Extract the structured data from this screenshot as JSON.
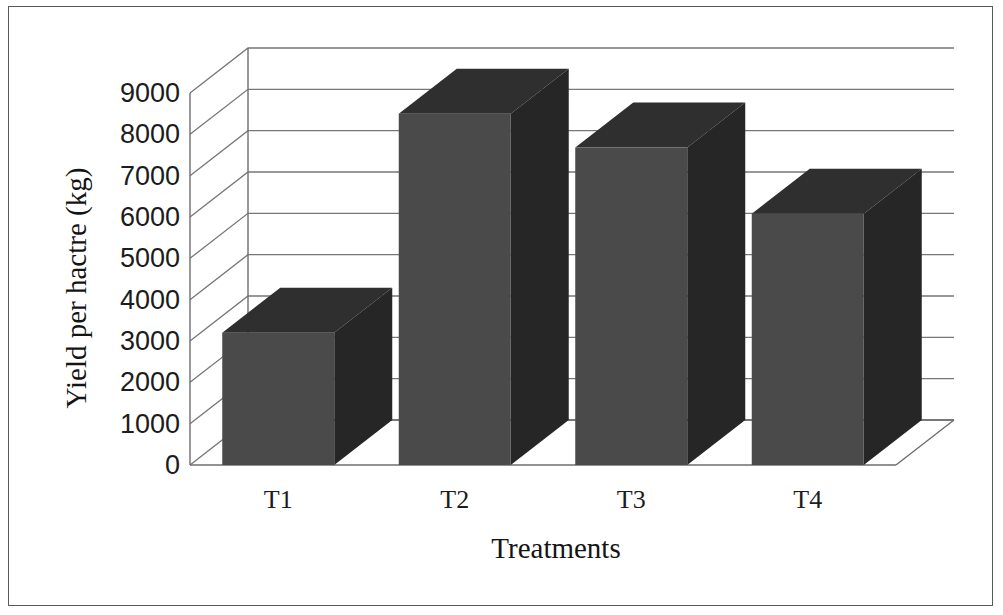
{
  "chart_data": {
    "type": "bar",
    "title": "",
    "subtitle": "",
    "categories": [
      "T1",
      "T2",
      "T3",
      "T4"
    ],
    "values": [
      3200,
      8500,
      7680,
      6080
    ],
    "xlabel": "Treatments",
    "ylabel": "Yield per hactre (kg)",
    "ylim": [
      0,
      9000
    ],
    "ytick_step": 1000,
    "yticks": [
      9000,
      8000,
      7000,
      6000,
      5000,
      4000,
      3000,
      2000,
      1000,
      0
    ],
    "ytick_labels": [
      "9000",
      "8000",
      "7000",
      "6000",
      "5000",
      "4000",
      "3000",
      "2000",
      "1000",
      "0"
    ],
    "grid": true,
    "legend": false,
    "legend_position": "none",
    "style": "3d-column",
    "series": [
      {
        "name": "Yield per hactre (kg)",
        "values": [
          3200,
          8500,
          7680,
          6080
        ]
      }
    ],
    "bar_front_color": "#4a4a4a",
    "bar_top_color": "#2f2f2f",
    "bar_side_color": "#262626",
    "gridline_color": "#777777",
    "wall_color": "#6e6e6e",
    "background_color": "#ffffff",
    "frame_color": "#5a5a5a",
    "text_color": "#1c1c1c"
  },
  "axes": {
    "y_title": "Yield per hactre (kg)",
    "x_title": "Treatments"
  },
  "ticks": {
    "y": [
      "9000",
      "8000",
      "7000",
      "6000",
      "5000",
      "4000",
      "3000",
      "2000",
      "1000",
      "0"
    ],
    "x": [
      "T1",
      "T2",
      "T3",
      "T4"
    ]
  }
}
